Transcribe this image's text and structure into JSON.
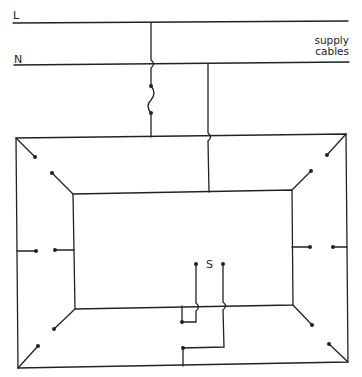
{
  "labels": {
    "live": "L",
    "neutral": "N",
    "supply_line1": "supply",
    "supply_line2": "cables",
    "switch": "S"
  },
  "colors": {
    "line": "#222222",
    "background": "#ffffff"
  },
  "components": {
    "supply_cables": [
      "L",
      "N"
    ],
    "fuse": "fuse-symbol",
    "switch": "S",
    "lamp_points": 12
  }
}
